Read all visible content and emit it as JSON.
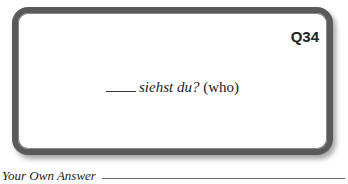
{
  "card": {
    "question_number": "Q34",
    "prompt_italic": "siehst du?",
    "prompt_hint": "(who)"
  },
  "answer": {
    "label": "Your Own Answer"
  }
}
